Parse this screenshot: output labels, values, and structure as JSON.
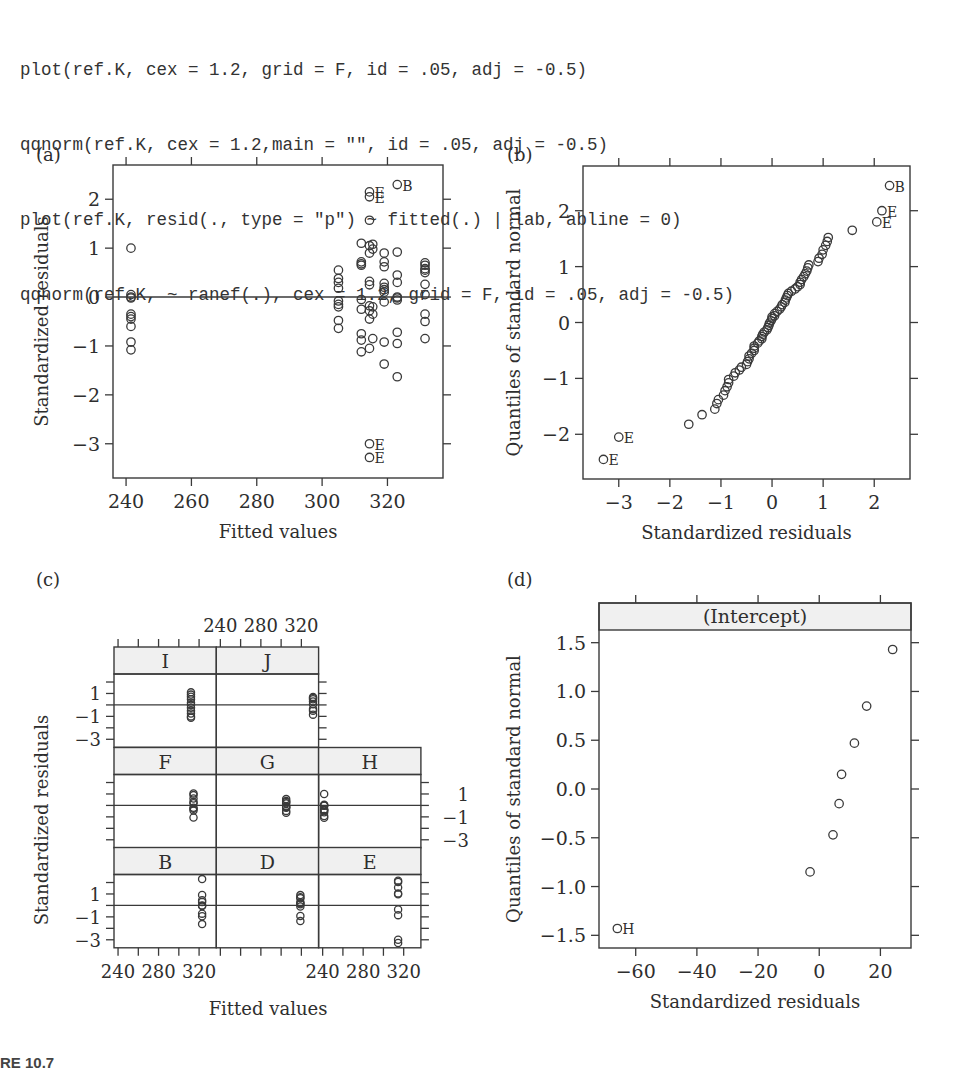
{
  "code_lines": [
    "plot(ref.K, cex = 1.2, grid = F, id = .05, adj = -0.5)",
    "qqnorm(ref.K, cex = 1.2,main = \"\", id = .05, adj = -0.5)",
    "plot(ref.K, resid(., type = \"p\") ~ fitted(.) | lab, abline = 0)",
    "qqnorm(ref.K, ~ ranef(.), cex = 1.2, grid = F, id = .05, adj = -0.5)"
  ],
  "caption": "RE 10.7",
  "panels": {
    "a": {
      "label": "(a)",
      "xlabel": "Fitted values",
      "ylabel": "Standardized residuals"
    },
    "b": {
      "label": "(b)",
      "xlabel": "Standardized residuals",
      "ylabel": "Quantiles of standard normal"
    },
    "c": {
      "label": "(c)",
      "xlabel": "Fitted values",
      "ylabel": "Standardized residuals"
    },
    "d": {
      "label": "(d)",
      "xlabel": "Standardized residuals",
      "ylabel": "Quantiles of standard normal",
      "strip": "(Intercept)"
    }
  },
  "chart_data": [
    {
      "id": "a",
      "type": "scatter",
      "title": "(a)",
      "xlabel": "Fitted values",
      "ylabel": "Standardized residuals",
      "xlim": [
        236,
        337
      ],
      "ylim": [
        -3.7,
        2.7
      ],
      "xticks": [
        240,
        260,
        280,
        300,
        320
      ],
      "yticks": [
        -3,
        -2,
        -1,
        0,
        1,
        2
      ],
      "grid": false,
      "hline": 0,
      "points": [
        [
          241.5,
          1.0
        ],
        [
          241.5,
          0.05
        ],
        [
          241.5,
          0.0
        ],
        [
          241.5,
          -0.02
        ],
        [
          241.5,
          -0.35
        ],
        [
          241.5,
          -0.4
        ],
        [
          241.5,
          -0.45
        ],
        [
          241.5,
          -0.6
        ],
        [
          241.5,
          -0.92
        ],
        [
          241.5,
          -1.08
        ],
        [
          305,
          0.55
        ],
        [
          305,
          0.38
        ],
        [
          305,
          0.3
        ],
        [
          305,
          0.18
        ],
        [
          305,
          -0.08
        ],
        [
          305,
          -0.15
        ],
        [
          305,
          -0.2
        ],
        [
          305,
          -0.48
        ],
        [
          305,
          -0.64
        ],
        [
          312,
          1.1
        ],
        [
          312,
          0.72
        ],
        [
          312,
          0.68
        ],
        [
          312,
          0.65
        ],
        [
          312,
          -0.05
        ],
        [
          312,
          -0.25
        ],
        [
          312,
          -0.75
        ],
        [
          312,
          -0.88
        ],
        [
          312,
          -1.12
        ],
        [
          314.5,
          2.15
        ],
        [
          314.5,
          2.05
        ],
        [
          314.5,
          1.57
        ],
        [
          314.5,
          1.05
        ],
        [
          314.5,
          0.9
        ],
        [
          314.5,
          0.32
        ],
        [
          314.5,
          0.25
        ],
        [
          314.5,
          -0.18
        ],
        [
          314.5,
          -0.28
        ],
        [
          314.5,
          -0.45
        ],
        [
          314.5,
          -1.05
        ],
        [
          314.5,
          -3.0
        ],
        [
          314.5,
          -3.28
        ],
        [
          315.5,
          1.08
        ],
        [
          315.5,
          0.98
        ],
        [
          315.5,
          -0.2
        ],
        [
          315.5,
          -0.35
        ],
        [
          315.5,
          -0.85
        ],
        [
          319,
          0.9
        ],
        [
          319,
          0.72
        ],
        [
          319,
          0.62
        ],
        [
          319,
          0.28
        ],
        [
          319,
          0.2
        ],
        [
          319,
          0.15
        ],
        [
          319,
          0.1
        ],
        [
          319,
          -0.1
        ],
        [
          319,
          -0.92
        ],
        [
          319,
          -1.37
        ],
        [
          323,
          2.3
        ],
        [
          323,
          0.92
        ],
        [
          323,
          0.45
        ],
        [
          323,
          0.3
        ],
        [
          323,
          0.0
        ],
        [
          323,
          -0.02
        ],
        [
          323,
          -0.06
        ],
        [
          323,
          -0.72
        ],
        [
          323,
          -0.95
        ],
        [
          323,
          -1.63
        ],
        [
          331.5,
          0.7
        ],
        [
          331.5,
          0.65
        ],
        [
          331.5,
          0.58
        ],
        [
          331.5,
          0.55
        ],
        [
          331.5,
          0.5
        ],
        [
          331.5,
          0.26
        ],
        [
          331.5,
          0.05
        ],
        [
          331.5,
          -0.35
        ],
        [
          331.5,
          -0.5
        ],
        [
          331.5,
          -0.85
        ]
      ],
      "annotations": [
        {
          "x": 314.5,
          "y": 2.15,
          "text": "E"
        },
        {
          "x": 314.5,
          "y": 2.05,
          "text": "E"
        },
        {
          "x": 323,
          "y": 2.3,
          "text": "B"
        },
        {
          "x": 314.5,
          "y": -3.0,
          "text": "E"
        },
        {
          "x": 314.5,
          "y": -3.28,
          "text": "E"
        }
      ]
    },
    {
      "id": "b",
      "type": "scatter",
      "title": "(b)",
      "xlabel": "Standardized residuals",
      "ylabel": "Quantiles of standard normal",
      "xlim": [
        -3.7,
        2.7
      ],
      "ylim": [
        -2.8,
        2.8
      ],
      "xticks": [
        -3,
        -2,
        -1,
        0,
        1,
        2
      ],
      "yticks": [
        -2,
        -1,
        0,
        1,
        2
      ],
      "grid": false,
      "points": [
        [
          -3.3,
          -2.45
        ],
        [
          -3.0,
          -2.05
        ],
        [
          -1.63,
          -1.82
        ],
        [
          -1.37,
          -1.65
        ],
        [
          -1.12,
          -1.55
        ],
        [
          -1.08,
          -1.45
        ],
        [
          -1.05,
          -1.38
        ],
        [
          -0.95,
          -1.3
        ],
        [
          -0.92,
          -1.22
        ],
        [
          -0.88,
          -1.15
        ],
        [
          -0.85,
          -1.08
        ],
        [
          -0.85,
          -1.02
        ],
        [
          -0.75,
          -0.96
        ],
        [
          -0.72,
          -0.9
        ],
        [
          -0.64,
          -0.85
        ],
        [
          -0.6,
          -0.8
        ],
        [
          -0.5,
          -0.75
        ],
        [
          -0.48,
          -0.7
        ],
        [
          -0.45,
          -0.65
        ],
        [
          -0.45,
          -0.6
        ],
        [
          -0.4,
          -0.55
        ],
        [
          -0.35,
          -0.5
        ],
        [
          -0.35,
          -0.46
        ],
        [
          -0.35,
          -0.42
        ],
        [
          -0.28,
          -0.37
        ],
        [
          -0.25,
          -0.33
        ],
        [
          -0.2,
          -0.29
        ],
        [
          -0.2,
          -0.25
        ],
        [
          -0.18,
          -0.21
        ],
        [
          -0.15,
          -0.17
        ],
        [
          -0.1,
          -0.13
        ],
        [
          -0.08,
          -0.09
        ],
        [
          -0.06,
          -0.05
        ],
        [
          -0.05,
          -0.01
        ],
        [
          -0.02,
          0.03
        ],
        [
          0.0,
          0.07
        ],
        [
          0.0,
          0.1
        ],
        [
          0.05,
          0.12
        ],
        [
          0.05,
          0.16
        ],
        [
          0.1,
          0.2
        ],
        [
          0.15,
          0.24
        ],
        [
          0.18,
          0.28
        ],
        [
          0.2,
          0.32
        ],
        [
          0.25,
          0.36
        ],
        [
          0.26,
          0.4
        ],
        [
          0.28,
          0.44
        ],
        [
          0.3,
          0.48
        ],
        [
          0.32,
          0.52
        ],
        [
          0.38,
          0.56
        ],
        [
          0.45,
          0.6
        ],
        [
          0.5,
          0.64
        ],
        [
          0.55,
          0.68
        ],
        [
          0.55,
          0.72
        ],
        [
          0.58,
          0.77
        ],
        [
          0.62,
          0.82
        ],
        [
          0.65,
          0.87
        ],
        [
          0.68,
          0.92
        ],
        [
          0.7,
          0.98
        ],
        [
          0.72,
          1.03
        ],
        [
          0.9,
          1.09
        ],
        [
          0.92,
          1.15
        ],
        [
          0.98,
          1.22
        ],
        [
          1.0,
          1.3
        ],
        [
          1.05,
          1.38
        ],
        [
          1.08,
          1.45
        ],
        [
          1.1,
          1.52
        ],
        [
          1.57,
          1.65
        ],
        [
          2.05,
          1.8
        ],
        [
          2.15,
          2.0
        ],
        [
          2.3,
          2.45
        ]
      ],
      "annotations": [
        {
          "x": -3.3,
          "y": -2.45,
          "text": "E"
        },
        {
          "x": -3.0,
          "y": -2.05,
          "text": "E"
        },
        {
          "x": 2.05,
          "y": 1.8,
          "text": "E"
        },
        {
          "x": 2.15,
          "y": 2.0,
          "text": "E"
        },
        {
          "x": 2.3,
          "y": 2.45,
          "text": "B"
        }
      ]
    },
    {
      "id": "c",
      "type": "scatter",
      "title": "(c)",
      "xlabel": "Fitted values",
      "ylabel": "Standardized residuals",
      "layout": "trellis 3x3 by lab",
      "xlim": [
        236,
        337
      ],
      "ylim": [
        -3.7,
        2.7
      ],
      "xticks": [
        240,
        280,
        320
      ],
      "yticks": [
        -3,
        -1,
        1
      ],
      "hline": 0,
      "panels": [
        {
          "lab": "I",
          "x": 312,
          "y": [
            1.1,
            0.9,
            0.72,
            0.5,
            0.2,
            0.0,
            -0.25,
            -0.5,
            -0.75,
            -1.0,
            -1.12
          ]
        },
        {
          "lab": "J",
          "x": 331.5,
          "y": [
            0.7,
            0.6,
            0.5,
            0.3,
            0.05,
            -0.35,
            -0.5,
            -0.85
          ]
        },
        {
          "lab": "F",
          "x": 314.5,
          "y": [
            1.05,
            0.9,
            0.6,
            0.3,
            0.2,
            -0.2,
            -0.3,
            -0.45,
            -1.05
          ]
        },
        {
          "lab": "G",
          "x": 305,
          "y": [
            0.55,
            0.38,
            0.3,
            0.18,
            -0.08,
            -0.15,
            -0.2,
            -0.48,
            -0.64
          ]
        },
        {
          "lab": "H",
          "x": 241.5,
          "y": [
            1.0,
            0.05,
            0.0,
            -0.02,
            -0.35,
            -0.4,
            -0.45,
            -0.6,
            -0.92,
            -1.08
          ]
        },
        {
          "lab": "B",
          "x": 323,
          "y": [
            2.3,
            0.92,
            0.45,
            0.3,
            0.0,
            -0.06,
            -0.72,
            -0.95,
            -1.63
          ]
        },
        {
          "lab": "D",
          "x": 319,
          "y": [
            0.9,
            0.72,
            0.62,
            0.28,
            0.2,
            0.1,
            -0.1,
            -0.92,
            -1.37
          ]
        },
        {
          "lab": "E",
          "x": 314.5,
          "y": [
            2.15,
            2.05,
            1.57,
            1.05,
            0.98,
            -0.35,
            -0.85,
            -3.0,
            -3.28
          ]
        }
      ]
    },
    {
      "id": "d",
      "type": "scatter",
      "title": "(d)",
      "strip": "(Intercept)",
      "xlabel": "Standardized residuals",
      "ylabel": "Quantiles of standard normal",
      "xlim": [
        -72,
        30
      ],
      "ylim": [
        -1.63,
        1.63
      ],
      "xticks": [
        -60,
        -40,
        -20,
        0,
        20
      ],
      "yticks": [
        -1.5,
        -1.0,
        -0.5,
        0.0,
        0.5,
        1.0,
        1.5
      ],
      "grid": false,
      "points": [
        [
          -66,
          -1.43
        ],
        [
          -3,
          -0.85
        ],
        [
          4.5,
          -0.47
        ],
        [
          6.5,
          -0.15
        ],
        [
          7.3,
          0.15
        ],
        [
          11.5,
          0.47
        ],
        [
          15.5,
          0.85
        ],
        [
          24,
          1.43
        ]
      ],
      "annotations": [
        {
          "x": -66,
          "y": -1.43,
          "text": "H"
        }
      ]
    }
  ]
}
